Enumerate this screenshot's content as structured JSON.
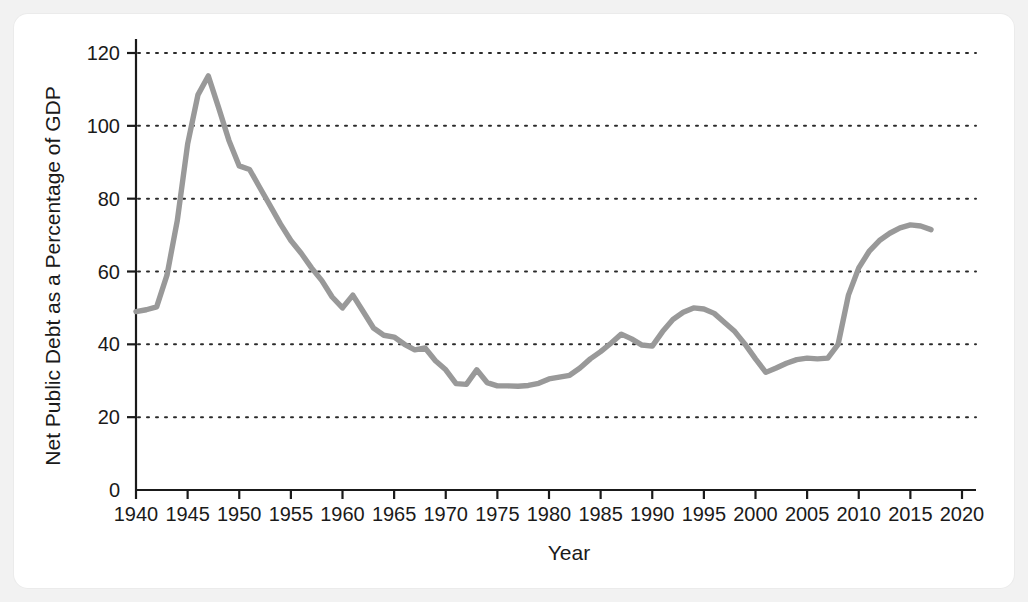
{
  "figure": {
    "background_color": "#f2f2f2",
    "card_color": "#ffffff",
    "line_color": "#999999",
    "axis_color": "#1a1a1a"
  },
  "chart_data": {
    "type": "line",
    "title": "",
    "xlabel": "Year",
    "ylabel": "Net Public Debt as a Percentage of GDP",
    "xlim": [
      1940,
      2020
    ],
    "ylim": [
      0,
      120
    ],
    "xticks": [
      1940,
      1945,
      1950,
      1955,
      1960,
      1965,
      1970,
      1975,
      1980,
      1985,
      1990,
      1995,
      2000,
      2005,
      2010,
      2015,
      2020
    ],
    "yticks": [
      0,
      20,
      40,
      60,
      80,
      100,
      120
    ],
    "xtick_labels": [
      "1940",
      "1945",
      "1950",
      "1955",
      "1960",
      "1965",
      "1970",
      "1975",
      "1980",
      "1985",
      "1990",
      "1995",
      "2000",
      "2005",
      "2010",
      "2015",
      "2020"
    ],
    "ytick_labels": [
      "0",
      "20",
      "40",
      "60",
      "80",
      "100",
      "120"
    ],
    "grid": "horizontal-dotted",
    "legend": "none",
    "series": [
      {
        "name": "Net Public Debt as a Percentage of GDP",
        "color": "#999999",
        "x": [
          1940,
          1941,
          1942,
          1943,
          1944,
          1945,
          1946,
          1947,
          1948,
          1949,
          1950,
          1951,
          1952,
          1953,
          1954,
          1955,
          1956,
          1957,
          1958,
          1959,
          1960,
          1961,
          1962,
          1963,
          1964,
          1965,
          1966,
          1967,
          1968,
          1969,
          1970,
          1971,
          1972,
          1973,
          1974,
          1975,
          1976,
          1977,
          1978,
          1979,
          1980,
          1981,
          1982,
          1983,
          1984,
          1985,
          1986,
          1987,
          1988,
          1989,
          1990,
          1991,
          1992,
          1993,
          1994,
          1995,
          1996,
          1997,
          1998,
          1999,
          2000,
          2001,
          2002,
          2003,
          2004,
          2005,
          2006,
          2007,
          2008,
          2009,
          2010,
          2011,
          2012,
          2013,
          2014,
          2015,
          2016,
          2017
        ],
        "y": [
          49.0,
          49.5,
          50.3,
          59.0,
          74.0,
          95.0,
          108.5,
          113.7,
          105.0,
          96.0,
          89.0,
          88.0,
          83.0,
          78.0,
          73.0,
          68.5,
          65.0,
          61.0,
          57.5,
          53.0,
          50.0,
          53.5,
          49.0,
          44.5,
          42.5,
          42.0,
          40.0,
          38.5,
          39.0,
          35.5,
          33.0,
          29.2,
          29.0,
          33.0,
          29.5,
          28.6,
          28.6,
          28.5,
          28.7,
          29.3,
          30.5,
          31.0,
          31.5,
          33.5,
          36.0,
          38.0,
          40.3,
          42.8,
          41.5,
          39.8,
          39.5,
          43.5,
          46.8,
          48.8,
          50.0,
          49.7,
          48.5,
          46.0,
          43.5,
          40.0,
          36.0,
          32.3,
          33.5,
          34.8,
          35.8,
          36.2,
          36.0,
          36.2,
          40.0,
          53.5,
          61.0,
          65.5,
          68.5,
          70.5,
          72.0,
          72.8,
          72.5,
          71.5
        ]
      }
    ],
    "annotations": []
  }
}
